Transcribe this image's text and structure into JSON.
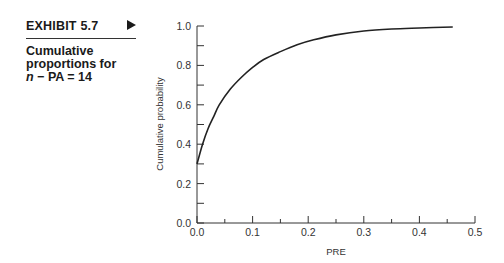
{
  "exhibit": {
    "label": "EXHIBIT 5.7",
    "arrow_icon": "right-triangle-icon",
    "caption_line1": "Cumulative",
    "caption_line2": "proportions for",
    "caption_line3_var": "n",
    "caption_line3_rest": " − PA = 14"
  },
  "chart_data": {
    "type": "line",
    "title": "Cumulative proportions for n − PA = 14",
    "xlabel": "PRE",
    "ylabel": "Cumulative probability",
    "xlim": [
      0.0,
      0.5
    ],
    "ylim": [
      0.0,
      1.0
    ],
    "x_ticks": [
      "0.0",
      "0.1",
      "0.2",
      "0.3",
      "0.4",
      "0.5"
    ],
    "y_ticks": [
      "0.0",
      "0.2",
      "0.4",
      "0.6",
      "0.8",
      "1.0"
    ],
    "x_minor_step": 0.05,
    "y_minor_step": 0.1,
    "grid": false,
    "legend": null,
    "series": [
      {
        "name": "Cumulative probability",
        "x": [
          0.0,
          0.01,
          0.02,
          0.03,
          0.04,
          0.06,
          0.08,
          0.1,
          0.12,
          0.15,
          0.18,
          0.21,
          0.25,
          0.3,
          0.35,
          0.4,
          0.46
        ],
        "y": [
          0.3,
          0.4,
          0.48,
          0.54,
          0.6,
          0.68,
          0.74,
          0.79,
          0.83,
          0.87,
          0.905,
          0.93,
          0.955,
          0.975,
          0.985,
          0.99,
          0.995
        ]
      }
    ]
  }
}
